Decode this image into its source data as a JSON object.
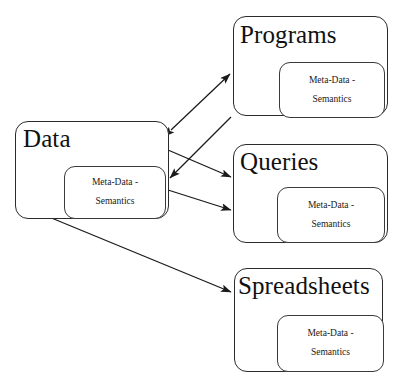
{
  "diagram": {
    "background_color": "#ffffff",
    "stroke_color": "#2b2b2b",
    "nodes": [
      {
        "id": "data",
        "label": "Data",
        "inner_label_line1": "Meta-Data -",
        "inner_label_line2": "Semantics"
      },
      {
        "id": "programs",
        "label": "Programs",
        "inner_label_line1": "Meta-Data -",
        "inner_label_line2": "Semantics"
      },
      {
        "id": "queries",
        "label": "Queries",
        "inner_label_line1": "Meta-Data -",
        "inner_label_line2": "Semantics"
      },
      {
        "id": "spreadsheets",
        "label": "Spreadsheets",
        "inner_label_line1": "Meta-Data -",
        "inner_label_line2": "Semantics"
      }
    ],
    "edges": [
      {
        "id": "data-programs",
        "from": "data",
        "to": "programs",
        "arrowheads": "both"
      },
      {
        "id": "programs-data",
        "from": "programs",
        "to": "data",
        "arrowheads": "end"
      },
      {
        "id": "data-queries-upper",
        "from": "data",
        "to": "queries",
        "arrowheads": "end"
      },
      {
        "id": "data-queries-lower",
        "from": "data",
        "to": "queries",
        "arrowheads": "end"
      },
      {
        "id": "data-spreadsheets",
        "from": "data",
        "to": "spreadsheets",
        "arrowheads": "end"
      }
    ]
  }
}
